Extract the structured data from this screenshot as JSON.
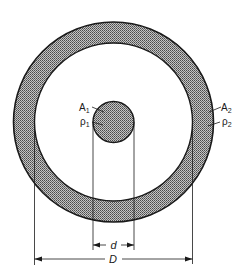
{
  "diagram": {
    "type": "concentric-cross-section",
    "colors": {
      "line": "#1a1a1a",
      "hatch_dark": "#555555",
      "hatch_light": "#bdbdbd",
      "background": "#ffffff"
    },
    "outer_ring": {
      "label_area": "A",
      "label_area_sub": "2",
      "label_density": "ρ",
      "label_density_sub": "2"
    },
    "inner_core": {
      "label_area": "A",
      "label_area_sub": "1",
      "label_density": "ρ",
      "label_density_sub": "1"
    },
    "dimensions": {
      "inner_diameter_label": "d",
      "outer_diameter_label": "D"
    }
  }
}
